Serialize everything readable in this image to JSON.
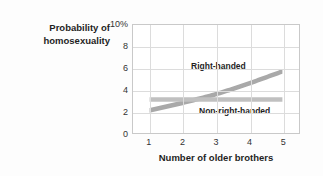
{
  "chart_data": {
    "type": "line",
    "title": "",
    "subtitle": "",
    "xlabel": "Number of older brothers",
    "ylabel": "Probability of homosexuality",
    "ylabel_lines": [
      "Probability of",
      "homosexuality"
    ],
    "x": [
      1,
      2,
      3,
      4,
      5
    ],
    "xlim": [
      0.5,
      5.5
    ],
    "ylim": [
      0,
      10
    ],
    "xticks": [
      "1",
      "2",
      "3",
      "4",
      "5"
    ],
    "yticks": [
      "10%",
      "8",
      "6",
      "4",
      "2",
      "0"
    ],
    "ytick_values": [
      10,
      8,
      6,
      4,
      2,
      0
    ],
    "grid": true,
    "legend_position": "in-plot annotations",
    "series": [
      {
        "name": "Right-handed",
        "values": [
          2.1,
          2.8,
          3.6,
          4.6,
          5.7
        ],
        "band_half_width": 0.22,
        "color": "#a9a9a9"
      },
      {
        "name": "Non-right-handed",
        "values": [
          3.1,
          3.1,
          3.1,
          3.1,
          3.1
        ],
        "band_half_width": 0.2,
        "color": "#c0c0c0"
      }
    ],
    "annotations": [
      {
        "text": "Right-handed",
        "series": "Right-handed"
      },
      {
        "text": "Non-right-handed",
        "series": "Non-right-handed"
      }
    ],
    "colors": {
      "right_handed_band": "#a9a9a9",
      "non_right_handed_band": "#c0c0c0",
      "gridline": "#dcdcdc",
      "frame": "#c9c9c9",
      "background": "#fdfdfd",
      "plot_background": "#ffffff",
      "text": "#1f1f1f"
    }
  }
}
